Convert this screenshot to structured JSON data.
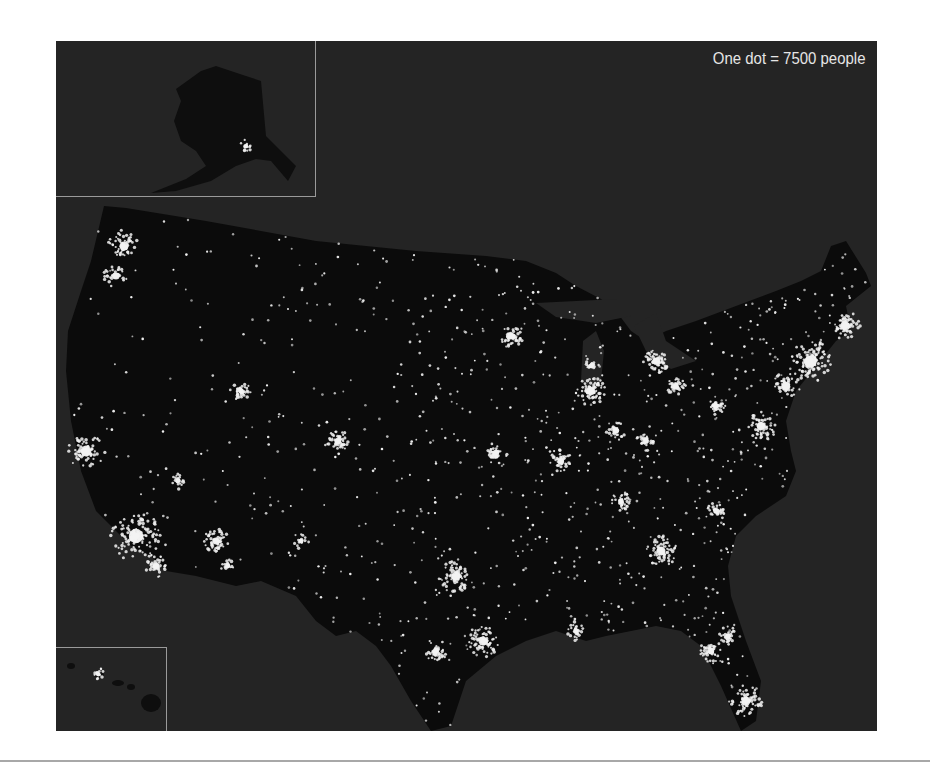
{
  "map": {
    "title": "U.S. population dot-density map",
    "legend": "One dot = 7500 people",
    "background_color": "#242424",
    "land_color": "#0b0b0b",
    "dot_color": "#f2f2f2",
    "insets": [
      {
        "name": "Alaska",
        "label": "alaska-inset"
      },
      {
        "name": "Hawaii",
        "label": "hawaii-inset"
      }
    ],
    "population_centers": [
      {
        "name": "Seattle",
        "x": 68,
        "y": 205,
        "r": 10,
        "n": 80
      },
      {
        "name": "Portland",
        "x": 60,
        "y": 235,
        "r": 8,
        "n": 50
      },
      {
        "name": "San Francisco Bay",
        "x": 30,
        "y": 410,
        "r": 12,
        "n": 110
      },
      {
        "name": "Los Angeles",
        "x": 80,
        "y": 495,
        "r": 16,
        "n": 180
      },
      {
        "name": "San Diego",
        "x": 100,
        "y": 525,
        "r": 7,
        "n": 50
      },
      {
        "name": "Las Vegas",
        "x": 122,
        "y": 440,
        "r": 5,
        "n": 30
      },
      {
        "name": "Phoenix",
        "x": 160,
        "y": 500,
        "r": 8,
        "n": 70
      },
      {
        "name": "Tucson",
        "x": 172,
        "y": 525,
        "r": 5,
        "n": 25
      },
      {
        "name": "Salt Lake City",
        "x": 185,
        "y": 350,
        "r": 6,
        "n": 50
      },
      {
        "name": "Denver",
        "x": 282,
        "y": 400,
        "r": 7,
        "n": 60
      },
      {
        "name": "Albuquerque",
        "x": 245,
        "y": 500,
        "r": 5,
        "n": 25
      },
      {
        "name": "Minneapolis",
        "x": 455,
        "y": 295,
        "r": 8,
        "n": 70
      },
      {
        "name": "Chicago",
        "x": 535,
        "y": 350,
        "r": 9,
        "n": 110
      },
      {
        "name": "Milwaukee",
        "x": 535,
        "y": 325,
        "r": 5,
        "n": 35
      },
      {
        "name": "Detroit",
        "x": 600,
        "y": 320,
        "r": 8,
        "n": 80
      },
      {
        "name": "Kansas City",
        "x": 440,
        "y": 412,
        "r": 7,
        "n": 55
      },
      {
        "name": "St. Louis",
        "x": 505,
        "y": 420,
        "r": 7,
        "n": 60
      },
      {
        "name": "Indianapolis",
        "x": 560,
        "y": 390,
        "r": 6,
        "n": 45
      },
      {
        "name": "Cincinnati",
        "x": 590,
        "y": 400,
        "r": 6,
        "n": 45
      },
      {
        "name": "Cleveland",
        "x": 620,
        "y": 345,
        "r": 6,
        "n": 50
      },
      {
        "name": "Pittsburgh",
        "x": 660,
        "y": 365,
        "r": 6,
        "n": 45
      },
      {
        "name": "Dallas",
        "x": 400,
        "y": 535,
        "r": 10,
        "n": 100
      },
      {
        "name": "Houston",
        "x": 427,
        "y": 600,
        "r": 10,
        "n": 100
      },
      {
        "name": "San Antonio",
        "x": 380,
        "y": 610,
        "r": 7,
        "n": 50
      },
      {
        "name": "Atlanta",
        "x": 605,
        "y": 510,
        "r": 10,
        "n": 100
      },
      {
        "name": "Nashville",
        "x": 565,
        "y": 460,
        "r": 6,
        "n": 40
      },
      {
        "name": "Charlotte",
        "x": 660,
        "y": 470,
        "r": 6,
        "n": 45
      },
      {
        "name": "Washington DC",
        "x": 705,
        "y": 385,
        "r": 9,
        "n": 90
      },
      {
        "name": "Philadelphia",
        "x": 730,
        "y": 345,
        "r": 9,
        "n": 90
      },
      {
        "name": "New York",
        "x": 755,
        "y": 320,
        "r": 13,
        "n": 180
      },
      {
        "name": "Boston",
        "x": 790,
        "y": 285,
        "r": 9,
        "n": 90
      },
      {
        "name": "Miami",
        "x": 690,
        "y": 660,
        "r": 10,
        "n": 90
      },
      {
        "name": "Tampa",
        "x": 655,
        "y": 610,
        "r": 7,
        "n": 50
      },
      {
        "name": "Orlando",
        "x": 672,
        "y": 595,
        "r": 6,
        "n": 40
      },
      {
        "name": "New Orleans",
        "x": 520,
        "y": 590,
        "r": 6,
        "n": 40
      },
      {
        "name": "Anchorage",
        "x": 190,
        "y": 105,
        "r": 4,
        "n": 20
      },
      {
        "name": "Honolulu",
        "x": 42,
        "y": 633,
        "r": 4,
        "n": 20
      }
    ]
  }
}
